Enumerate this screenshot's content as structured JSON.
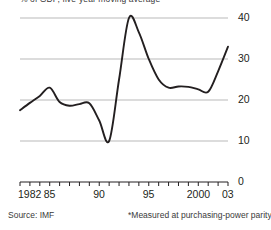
{
  "chart_data": {
    "type": "line",
    "title": "",
    "subtitle": "% of GDP, five-year moving average",
    "xlabel": "",
    "ylabel": "",
    "xlim": [
      1982,
      2003
    ],
    "ylim": [
      0,
      40
    ],
    "y_ticks": [
      0,
      10,
      20,
      30,
      40
    ],
    "y_tick_labels": [
      "0",
      "10",
      "20",
      "30",
      "40"
    ],
    "x_ticks": [
      1982,
      1983,
      1984,
      1985,
      1986,
      1987,
      1988,
      1989,
      1990,
      1991,
      1992,
      1993,
      1994,
      1995,
      1996,
      1997,
      1998,
      1999,
      2000,
      2001,
      2002,
      2003
    ],
    "x_tick_labels": [
      {
        "x": 1982,
        "label": "1982"
      },
      {
        "x": 1985,
        "label": "85"
      },
      {
        "x": 1990,
        "label": "90"
      },
      {
        "x": 1995,
        "label": "95"
      },
      {
        "x": 2000,
        "label": "2000"
      },
      {
        "x": 2003,
        "label": "03"
      }
    ],
    "grid": true,
    "grid_axis": "y",
    "legend": "none",
    "y_axis_side": "right",
    "series": [
      {
        "name": "series-1",
        "color": "#231f20",
        "x": [
          1982,
          1983,
          1984,
          1985,
          1986,
          1987,
          1988,
          1989,
          1990,
          1991,
          1992,
          1993,
          1994,
          1995,
          1996,
          1997,
          1998,
          1999,
          2000,
          2001,
          2002,
          2003
        ],
        "values": [
          17.5,
          19.3,
          21.0,
          23.0,
          19.5,
          18.6,
          19.0,
          19.2,
          15.0,
          10.0,
          25.0,
          40.0,
          36.5,
          30.0,
          25.0,
          23.0,
          23.3,
          23.2,
          22.6,
          22.0,
          27.0,
          33.0
        ]
      }
    ]
  },
  "footer": {
    "source": "Source: IMF",
    "footnote": "*Measured at purchasing-power parity"
  },
  "colors": {
    "line": "#231f20",
    "grid": "#b9b9b9",
    "axis": "#231f20",
    "text": "#231f20"
  }
}
